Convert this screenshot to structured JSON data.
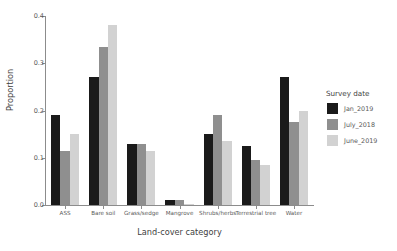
{
  "chart_data": {
    "type": "bar",
    "title": "",
    "xlabel": "Land-cover category",
    "ylabel": "Proportion",
    "categories": [
      "ASS",
      "Bare soil",
      "Grass/sedge",
      "Mangrove",
      "Shrubs/herbs",
      "Terrestrial tree",
      "Water"
    ],
    "series": [
      {
        "name": "Jan_2019",
        "color": "#1a1a1a",
        "values": [
          0.19,
          0.27,
          0.13,
          0.01,
          0.15,
          0.125,
          0.27
        ]
      },
      {
        "name": "July_2018",
        "color": "#8f8f8f",
        "values": [
          0.115,
          0.335,
          0.13,
          0.01,
          0.19,
          0.095,
          0.175
        ]
      },
      {
        "name": "June_2019",
        "color": "#d2d2d2",
        "values": [
          0.15,
          0.38,
          0.115,
          0.002,
          0.135,
          0.085,
          0.2
        ]
      }
    ],
    "ylim": [
      0,
      0.4
    ],
    "yticks": [
      "0.0",
      "0.1",
      "0.2",
      "0.3",
      "0.4"
    ],
    "ytick_values": [
      0.0,
      0.1,
      0.2,
      0.3,
      0.4
    ],
    "grid": false,
    "legend_position": "right",
    "legend_title": "Survey date"
  },
  "axes": {
    "x_title": "Land-cover category",
    "y_title": "Proportion"
  },
  "legend": {
    "title": "Survey date",
    "entries": [
      {
        "label": "Jan_2019",
        "color": "#1a1a1a"
      },
      {
        "label": "July_2018",
        "color": "#8f8f8f"
      },
      {
        "label": "June_2019",
        "color": "#d2d2d2"
      }
    ]
  }
}
